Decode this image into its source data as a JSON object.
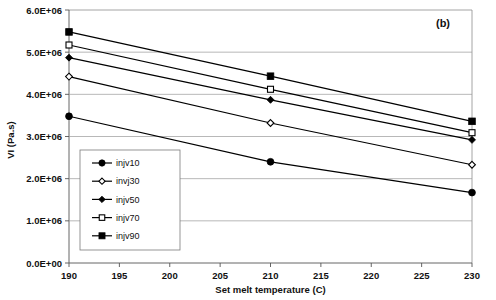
{
  "panel": {
    "label": "(b)"
  },
  "chart_data": {
    "type": "line",
    "title": "",
    "subtitle": "",
    "annotations": [
      "(b)"
    ],
    "xlabel": "Set melt temperature (C)",
    "ylabel": "VI (Pa.s)",
    "x": [
      190,
      210,
      230
    ],
    "xlim": [
      190,
      230
    ],
    "ylim": [
      0,
      6000000
    ],
    "xticks": [
      190,
      195,
      200,
      205,
      210,
      215,
      220,
      225,
      230
    ],
    "xtick_labels": [
      "190",
      "195",
      "200",
      "205",
      "210",
      "215",
      "220",
      "225",
      "230"
    ],
    "yticks": [
      0,
      1000000,
      2000000,
      3000000,
      4000000,
      5000000,
      6000000
    ],
    "ytick_labels": [
      "0.0E+00",
      "1.0E+06",
      "2.0E+06",
      "3.0E+06",
      "4.0E+06",
      "5.0E+06",
      "6.0E+06"
    ],
    "grid": "horizontal",
    "legend_position": "inside-lower-left",
    "series": [
      {
        "name": "injv10",
        "marker": "filled-circle",
        "color": "#000000",
        "values": [
          3480000,
          2400000,
          1670000
        ]
      },
      {
        "name": "invj30",
        "marker": "open-diamond",
        "color": "#000000",
        "values": [
          4420000,
          3320000,
          2330000
        ]
      },
      {
        "name": "injv50",
        "marker": "filled-diamond",
        "color": "#000000",
        "values": [
          4870000,
          3870000,
          2920000
        ]
      },
      {
        "name": "injv70",
        "marker": "open-square",
        "color": "#000000",
        "values": [
          5170000,
          4120000,
          3090000
        ]
      },
      {
        "name": "injv90",
        "marker": "filled-square",
        "color": "#000000",
        "values": [
          5480000,
          4430000,
          3360000
        ]
      }
    ]
  }
}
